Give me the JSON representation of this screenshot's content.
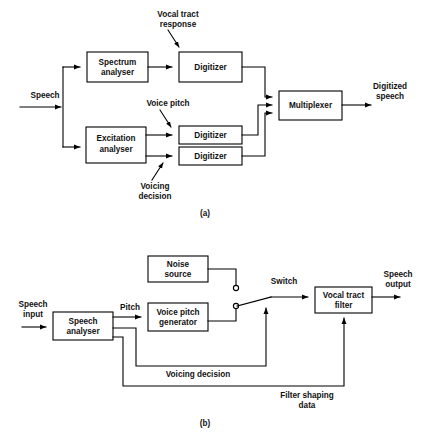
{
  "figure": {
    "background": "#ffffff",
    "line_color": "#000000",
    "text_color": "#111111"
  },
  "diagram_a": {
    "caption": "(a)",
    "blocks": [
      {
        "id": "spectrum-analyser",
        "line1": "Spectrum",
        "line2": "analyser"
      },
      {
        "id": "digitizer-top",
        "line1": "Digitizer",
        "line2": ""
      },
      {
        "id": "excitation-analyser",
        "line1": "Excitation",
        "line2": "analyser"
      },
      {
        "id": "digitizer-mid",
        "line1": "Digitizer",
        "line2": ""
      },
      {
        "id": "digitizer-low",
        "line1": "Digitizer",
        "line2": ""
      },
      {
        "id": "multiplexer",
        "line1": "Multiplexer",
        "line2": ""
      }
    ],
    "labels": {
      "input": "Speech",
      "output_line1": "Digitized",
      "output_line2": "speech",
      "vocal_tract_line1": "Vocal tract",
      "vocal_tract_line2": "response",
      "voice_pitch": "Voice pitch",
      "voicing_line1": "Voicing",
      "voicing_line2": "decision"
    }
  },
  "diagram_b": {
    "caption": "(b)",
    "blocks": [
      {
        "id": "noise-source",
        "line1": "Noise",
        "line2": "source"
      },
      {
        "id": "voice-pitch-generator",
        "line1": "Voice pitch",
        "line2": "generator"
      },
      {
        "id": "speech-analyser",
        "line1": "Speech",
        "line2": "analyser"
      },
      {
        "id": "vocal-tract-filter",
        "line1": "Vocal tract",
        "line2": "filter"
      }
    ],
    "labels": {
      "input_line1": "Speech",
      "input_line2": "input",
      "output_line1": "Speech",
      "output_line2": "output",
      "pitch": "Pitch",
      "switch": "Switch",
      "voicing_decision": "Voicing decision",
      "filter_shaping_line1": "Filter shaping",
      "filter_shaping_line2": "data"
    }
  }
}
